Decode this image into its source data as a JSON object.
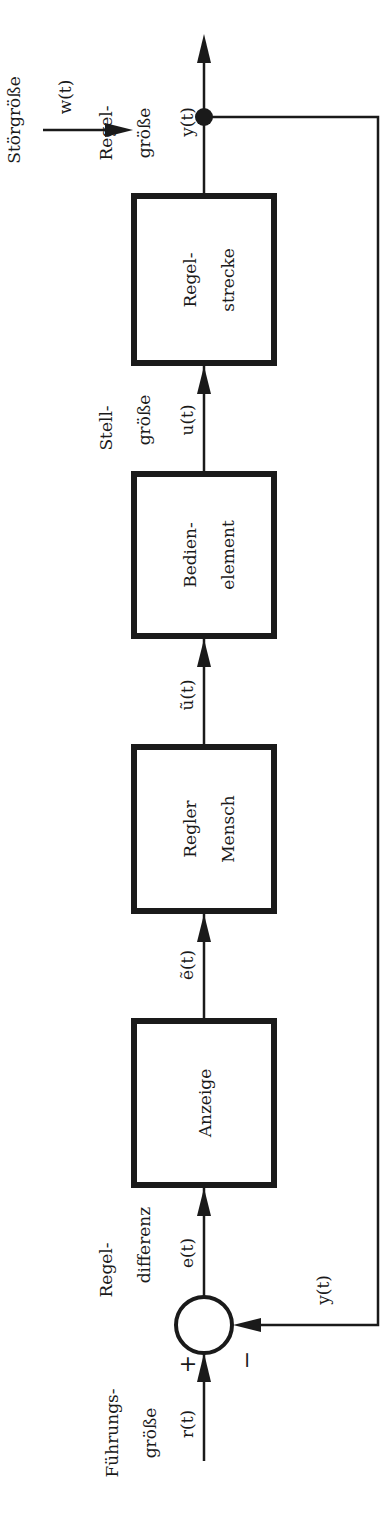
{
  "diagram": {
    "orientation": "rotated-90-ccw",
    "colors": {
      "line": "#1a1a1a",
      "background": "#ffffff"
    },
    "blocks": [
      {
        "id": "anzeige",
        "line1": "Anzeige",
        "line2": ""
      },
      {
        "id": "regler",
        "line1": "Regler",
        "line2": "Mensch"
      },
      {
        "id": "bedienelement",
        "line1": "Bedien-",
        "line2": "element"
      },
      {
        "id": "regelstrecke",
        "line1": "Regel-",
        "line2": "strecke"
      }
    ],
    "summing_junction": {
      "plus_sign": "+",
      "minus_sign": "−"
    },
    "signals": {
      "reference": {
        "name_line1": "Führungs-",
        "name_line2": "größe",
        "symbol": "r(t)"
      },
      "error": {
        "name_line1": "Regel-",
        "name_line2": "differenz",
        "symbol": "e(t)"
      },
      "displayed_error": {
        "symbol": "ẽ(t)"
      },
      "controller_output": {
        "symbol": "ũ(t)"
      },
      "actuating": {
        "name_line1": "Stell-",
        "name_line2": "größe",
        "symbol": "u(t)"
      },
      "disturbance": {
        "name": "Störgröße",
        "symbol": "w(t)"
      },
      "output": {
        "name_line1": "Regel-",
        "name_line2": "größe",
        "symbol": "y(t)"
      },
      "feedback": {
        "symbol": "y(t)"
      }
    }
  }
}
